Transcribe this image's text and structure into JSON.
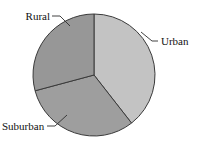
{
  "chart_data": {
    "type": "pie",
    "title": "",
    "subtitle": "",
    "xlabel": "",
    "ylabel": "",
    "legend_position": "none",
    "grid": false,
    "labels_outside": true,
    "categories": [
      "Urban",
      "Suburban",
      "Rural"
    ],
    "values": [
      39.5,
      31.5,
      29.0
    ],
    "units": "percent",
    "start_angle_deg": 0,
    "direction": "clockwise",
    "slices": [
      {
        "label": "Urban",
        "value": 39.5,
        "angle_deg": 142,
        "start_angle_deg": 0,
        "end_angle_deg": 142,
        "color": "#c3c3c3"
      },
      {
        "label": "Suburban",
        "value": 31.5,
        "angle_deg": 113,
        "start_angle_deg": 142,
        "end_angle_deg": 255,
        "color": "#9e9e9e"
      },
      {
        "label": "Rural",
        "value": 29.0,
        "angle_deg": 105,
        "start_angle_deg": 255,
        "end_angle_deg": 360,
        "color": "#979797"
      }
    ],
    "annotations": [
      {
        "name": "rural-leader",
        "label": "Rural"
      },
      {
        "name": "urban-leader",
        "label": "Urban"
      },
      {
        "name": "suburban-leader",
        "label": "Suburban"
      }
    ]
  },
  "labels": {
    "rural": "Rural",
    "urban": "Urban",
    "suburban": "Suburban"
  },
  "colors": {
    "urban": "#c3c3c3",
    "suburban": "#9e9e9e",
    "rural": "#979797",
    "outline": "#3a3a3a",
    "text": "#111111",
    "background": "#ffffff"
  },
  "geometry": {
    "center_x": 94,
    "center_y": 75,
    "radius": 61
  }
}
